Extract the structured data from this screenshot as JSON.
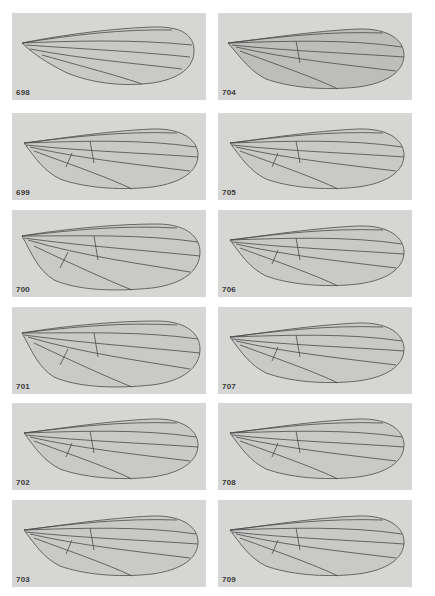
{
  "figure": {
    "columns": [
      {
        "panels": [
          {
            "label": "698",
            "variant": "slender"
          },
          {
            "label": "699",
            "variant": "standard"
          },
          {
            "label": "700",
            "variant": "broad"
          },
          {
            "label": "701",
            "variant": "broad"
          },
          {
            "label": "702",
            "variant": "standard"
          },
          {
            "label": "703",
            "variant": "standard"
          }
        ]
      },
      {
        "panels": [
          {
            "label": "704",
            "variant": "shaded"
          },
          {
            "label": "705",
            "variant": "standard"
          },
          {
            "label": "706",
            "variant": "standard"
          },
          {
            "label": "707",
            "variant": "standard"
          },
          {
            "label": "708",
            "variant": "standard"
          },
          {
            "label": "709",
            "variant": "standard"
          }
        ]
      }
    ],
    "colors": {
      "panel_bg": "#d6d6d4",
      "wing_membrane": "#c8c8c6",
      "vein": "#4a4a4a",
      "page_bg": "#ffffff"
    }
  }
}
